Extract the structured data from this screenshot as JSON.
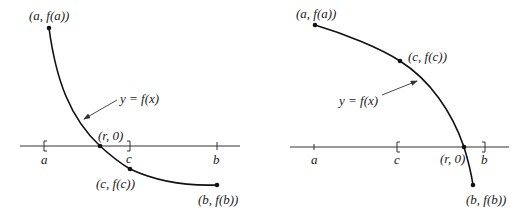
{
  "figure": {
    "left_panel": {
      "description": "Bisection step where root lies in left half [a, c]",
      "curve_label": "y = f(x)",
      "points": {
        "start": "(a, f(a))",
        "root": "(r, 0)",
        "mid": "(c, f(c))",
        "end": "(b, f(b))"
      },
      "axis_labels": {
        "a": "a",
        "c": "c",
        "b": "b"
      },
      "interval_brackets": [
        "[ at a",
        "] at c"
      ]
    },
    "right_panel": {
      "description": "Bisection step where root lies in right half [c, b]",
      "curve_label": "y = f(x)",
      "points": {
        "start": "(a, f(a))",
        "mid": "(c, f(c))",
        "root": "(r, 0)",
        "end": "(b, f(b))"
      },
      "axis_labels": {
        "a": "a",
        "c": "c",
        "b": "b"
      },
      "interval_brackets": [
        "[ at c",
        "] at b"
      ]
    },
    "colors": {
      "curve": "#111111",
      "axis": "#333333",
      "background": "#ffffff"
    }
  }
}
